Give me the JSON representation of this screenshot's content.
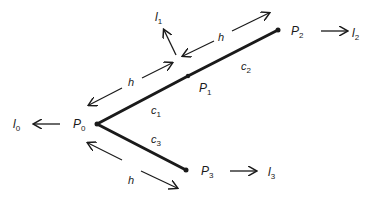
{
  "diagram": {
    "colors": {
      "stroke": "#1a1a1a",
      "background": "#ffffff"
    },
    "nodes": [
      {
        "id": "P0",
        "base": "P",
        "sub": "0"
      },
      {
        "id": "P1",
        "base": "P",
        "sub": "1"
      },
      {
        "id": "P2",
        "base": "P",
        "sub": "2"
      },
      {
        "id": "P3",
        "base": "P",
        "sub": "3"
      }
    ],
    "segments": [
      {
        "id": "c1",
        "base": "c",
        "sub": "1",
        "from": "P0",
        "to": "P1"
      },
      {
        "id": "c2",
        "base": "c",
        "sub": "2",
        "from": "P1",
        "to": "P2"
      },
      {
        "id": "c3",
        "base": "c",
        "sub": "3",
        "from": "P0",
        "to": "P3"
      }
    ],
    "directions": [
      {
        "id": "l0",
        "base": "l",
        "sub": "0",
        "at": "P0"
      },
      {
        "id": "l1",
        "base": "l",
        "sub": "1",
        "at": "P1"
      },
      {
        "id": "l2",
        "base": "l",
        "sub": "2",
        "at": "P2"
      },
      {
        "id": "l3",
        "base": "l",
        "sub": "3",
        "at": "P3"
      }
    ],
    "spacing": [
      {
        "id": "h_c1",
        "label": "h",
        "along": "c1"
      },
      {
        "id": "h_c2",
        "label": "h",
        "along": "c2"
      },
      {
        "id": "h_c3",
        "label": "h",
        "along": "c3"
      }
    ]
  }
}
